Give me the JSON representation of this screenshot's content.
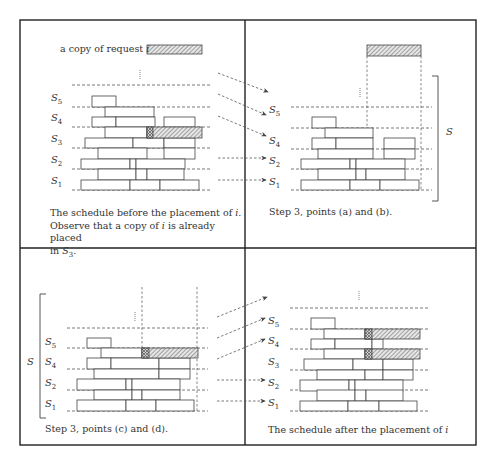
{
  "figure": {
    "frame": {
      "x": 20,
      "y": 20,
      "w": 456,
      "h": 425,
      "mid_x": 245,
      "mid_y": 248
    },
    "colors": {
      "line": "#444444",
      "dash": "#555555",
      "hatch": "#777777",
      "frame": "#222222"
    },
    "panels": [
      {
        "id": "top-left",
        "caption_lines": [
          "The schedule before the placement of i.",
          "Observe that a copy of i is already placed",
          "in S3."
        ],
        "copy_label": "a copy of request i",
        "copy_box": {
          "x": 147,
          "y": 45,
          "w": 55,
          "h": 9
        },
        "dots": {
          "x": 140,
          "y1": 70,
          "y2": 79
        },
        "dash_lines": {
          "x1": 72,
          "x2": 212,
          "ys": [
            85,
            107,
            127,
            148,
            169,
            190
          ]
        },
        "labels": [
          {
            "text": "S",
            "sub": "5",
            "x": 51,
            "y": 92
          },
          {
            "text": "S",
            "sub": "4",
            "x": 51,
            "y": 112
          },
          {
            "text": "S",
            "sub": "3",
            "x": 51,
            "y": 133
          },
          {
            "text": "S",
            "sub": "2",
            "x": 51,
            "y": 154
          },
          {
            "text": "S",
            "sub": "1",
            "x": 51,
            "y": 175
          }
        ],
        "rects": [
          [
            92,
            96,
            24,
            11
          ],
          [
            105,
            107,
            49,
            10
          ],
          [
            92,
            117,
            24,
            10
          ],
          [
            116,
            117,
            39,
            10
          ],
          [
            164,
            117,
            31,
            10
          ],
          [
            105,
            127,
            42,
            11
          ],
          [
            85,
            138,
            48,
            10
          ],
          [
            133,
            138,
            31,
            10
          ],
          [
            164,
            138,
            31,
            10
          ],
          [
            98,
            148,
            49,
            11
          ],
          [
            164,
            148,
            31,
            11
          ],
          [
            81,
            159,
            49,
            10
          ],
          [
            130,
            159,
            6,
            10
          ],
          [
            136,
            159,
            49,
            10
          ],
          [
            98,
            169,
            38,
            11
          ],
          [
            136,
            169,
            11,
            11
          ],
          [
            147,
            169,
            37,
            11
          ],
          [
            81,
            180,
            49,
            10
          ],
          [
            130,
            180,
            30,
            10
          ],
          [
            160,
            180,
            39,
            10
          ]
        ],
        "hatched": [
          [
            147,
            127,
            55,
            11
          ]
        ],
        "crosshatched": [
          [
            147,
            127,
            6,
            11
          ]
        ],
        "vdash": [],
        "bracket": null
      },
      {
        "id": "top-right",
        "caption_lines": [
          "Step 3, points (a) and (b)."
        ],
        "copy_label": "",
        "copy_box": {
          "x": 367,
          "y": 45,
          "w": 54,
          "h": 11
        },
        "dots": {
          "x": 360,
          "y1": 88,
          "y2": 98
        },
        "dash_lines": {
          "x1": 291,
          "x2": 432,
          "ys": [
            107,
            128,
            149,
            169,
            190
          ]
        },
        "labels": [
          {
            "text": "S",
            "sub": "5",
            "x": 269,
            "y": 104
          },
          {
            "text": "S",
            "sub": "4",
            "x": 269,
            "y": 135
          },
          {
            "text": "S",
            "sub": "2",
            "x": 269,
            "y": 155
          },
          {
            "text": "S",
            "sub": "1",
            "x": 269,
            "y": 176
          }
        ],
        "rects": [
          [
            312,
            117,
            24,
            11
          ],
          [
            325,
            128,
            48,
            10
          ],
          [
            312,
            138,
            24,
            11
          ],
          [
            336,
            138,
            37,
            11
          ],
          [
            384,
            138,
            31,
            11
          ],
          [
            318,
            149,
            55,
            10
          ],
          [
            384,
            149,
            31,
            10
          ],
          [
            301,
            159,
            49,
            10
          ],
          [
            350,
            159,
            6,
            10
          ],
          [
            356,
            159,
            49,
            10
          ],
          [
            318,
            169,
            38,
            11
          ],
          [
            356,
            169,
            10,
            11
          ],
          [
            366,
            169,
            39,
            11
          ],
          [
            301,
            180,
            49,
            10
          ],
          [
            350,
            180,
            30,
            10
          ],
          [
            380,
            180,
            39,
            10
          ]
        ],
        "hatched": [],
        "crosshatched": [],
        "vdash": [
          {
            "x": 367,
            "y1": 56,
            "y2": 190
          },
          {
            "x": 421,
            "y1": 56,
            "y2": 190
          }
        ],
        "bracket": {
          "x": 438,
          "y1": 76,
          "y2": 201,
          "label": "S",
          "label_x": 446,
          "label_y": 126,
          "side": "right"
        }
      },
      {
        "id": "bottom-left",
        "caption_lines": [
          "Step 3, points (c) and (d)."
        ],
        "copy_label": "",
        "copy_box": null,
        "dots": {
          "x": 135,
          "y1": 312,
          "y2": 321
        },
        "dash_lines": {
          "x1": 67,
          "x2": 208,
          "ys": [
            328,
            348,
            369,
            390,
            411
          ]
        },
        "labels": [
          {
            "text": "S",
            "sub": "5",
            "x": 45,
            "y": 336
          },
          {
            "text": "S",
            "sub": "4",
            "x": 45,
            "y": 356
          },
          {
            "text": "S",
            "sub": "2",
            "x": 45,
            "y": 377
          },
          {
            "text": "S",
            "sub": "1",
            "x": 45,
            "y": 398
          }
        ],
        "rects": [
          [
            87,
            338,
            24,
            10
          ],
          [
            101,
            348,
            41,
            10
          ],
          [
            87,
            358,
            24,
            11
          ],
          [
            111,
            358,
            48,
            11
          ],
          [
            159,
            358,
            31,
            11
          ],
          [
            94,
            369,
            65,
            10
          ],
          [
            159,
            369,
            31,
            10
          ],
          [
            77,
            379,
            49,
            11
          ],
          [
            126,
            379,
            6,
            11
          ],
          [
            132,
            379,
            48,
            11
          ],
          [
            94,
            390,
            38,
            10
          ],
          [
            132,
            390,
            10,
            10
          ],
          [
            142,
            390,
            38,
            10
          ],
          [
            77,
            400,
            49,
            11
          ],
          [
            126,
            400,
            30,
            11
          ],
          [
            156,
            400,
            38,
            11
          ]
        ],
        "hatched": [
          [
            142,
            348,
            56,
            10
          ]
        ],
        "crosshatched": [
          [
            142,
            348,
            7,
            10
          ]
        ],
        "vdash": [
          {
            "x": 142,
            "y1": 287,
            "y2": 411
          },
          {
            "x": 197,
            "y1": 287,
            "y2": 411
          }
        ],
        "bracket": {
          "x": 40,
          "y1": 294,
          "y2": 418,
          "label": "S",
          "label_x": 27,
          "label_y": 356,
          "side": "left"
        }
      },
      {
        "id": "bottom-right",
        "caption_lines": [
          "The schedule after the placement of i"
        ],
        "copy_label": "",
        "copy_box": null,
        "dots": {
          "x": 359,
          "y1": 291,
          "y2": 300
        },
        "dash_lines": {
          "x1": 290,
          "x2": 430,
          "ys": [
            308,
            329,
            349,
            370,
            390,
            411
          ]
        },
        "labels": [
          {
            "text": "S",
            "sub": "5",
            "x": 268,
            "y": 315
          },
          {
            "text": "S",
            "sub": "4",
            "x": 268,
            "y": 335
          },
          {
            "text": "S",
            "sub": "3",
            "x": 268,
            "y": 356
          },
          {
            "text": "S",
            "sub": "2",
            "x": 268,
            "y": 377
          },
          {
            "text": "S",
            "sub": "1",
            "x": 268,
            "y": 397
          }
        ],
        "rects": [
          [
            311,
            318,
            24,
            11
          ],
          [
            324,
            329,
            41,
            10
          ],
          [
            311,
            339,
            24,
            10
          ],
          [
            335,
            339,
            37,
            10
          ],
          [
            372,
            339,
            11,
            10
          ],
          [
            324,
            349,
            41,
            10
          ],
          [
            304,
            359,
            49,
            11
          ],
          [
            353,
            359,
            30,
            11
          ],
          [
            383,
            359,
            30,
            11
          ],
          [
            317,
            370,
            48,
            10
          ],
          [
            365,
            370,
            18,
            10
          ],
          [
            383,
            370,
            30,
            10
          ],
          [
            300,
            380,
            49,
            11
          ],
          [
            349,
            380,
            6,
            11
          ],
          [
            355,
            380,
            48,
            11
          ],
          [
            317,
            390,
            38,
            11
          ],
          [
            355,
            390,
            11,
            11
          ],
          [
            366,
            390,
            37,
            11
          ],
          [
            300,
            401,
            48,
            10
          ],
          [
            348,
            401,
            31,
            10
          ],
          [
            379,
            401,
            38,
            10
          ]
        ],
        "hatched": [
          [
            365,
            329,
            55,
            10
          ],
          [
            365,
            349,
            55,
            10
          ]
        ],
        "crosshatched": [
          [
            365,
            329,
            7,
            10
          ],
          [
            365,
            349,
            7,
            10
          ]
        ],
        "vdash": [],
        "bracket": null
      }
    ],
    "arrows": [
      {
        "x1": 218,
        "y1": 73,
        "x2": 268,
        "y2": 92
      },
      {
        "x1": 218,
        "y1": 94,
        "x2": 266,
        "y2": 115
      },
      {
        "x1": 218,
        "y1": 116,
        "x2": 266,
        "y2": 136
      },
      {
        "x1": 218,
        "y1": 158,
        "x2": 266,
        "y2": 158
      },
      {
        "x1": 218,
        "y1": 180,
        "x2": 266,
        "y2": 180
      },
      {
        "x1": 217,
        "y1": 317,
        "x2": 267,
        "y2": 297
      },
      {
        "x1": 217,
        "y1": 338,
        "x2": 265,
        "y2": 318
      },
      {
        "x1": 217,
        "y1": 359,
        "x2": 265,
        "y2": 339
      },
      {
        "x1": 217,
        "y1": 380,
        "x2": 265,
        "y2": 380
      },
      {
        "x1": 217,
        "y1": 401,
        "x2": 265,
        "y2": 401
      }
    ]
  },
  "captions": {
    "tl_1": "The schedule before the placement of ",
    "tl_1_i": "i",
    "tl_1_end": ".",
    "tl_2": "Observe that a copy of ",
    "tl_2_i": "i",
    "tl_2_end": " is already placed",
    "tl_3": "in ",
    "tl_3_s": "S",
    "tl_3_sub": "3",
    "tl_3_end": ".",
    "copy_text": "a copy of request ",
    "copy_i": "i",
    "tr": "Step 3, points (a) and (b).",
    "bl": "Step 3, points (c) and (d).",
    "br": "The schedule after the placement of ",
    "br_i": "i",
    "bracket_label": "S"
  }
}
